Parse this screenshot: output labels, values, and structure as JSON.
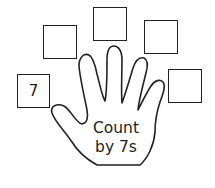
{
  "worksheet": {
    "hand_label_line1": "Count",
    "hand_label_line2": "by 7s",
    "boxes": [
      {
        "value": "7"
      },
      {
        "value": ""
      },
      {
        "value": ""
      },
      {
        "value": ""
      },
      {
        "value": ""
      }
    ]
  },
  "colors": {
    "stroke": "#222222",
    "background": "#ffffff"
  }
}
